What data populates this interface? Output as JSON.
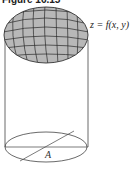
{
  "figure": {
    "caption": "Figure 16.15",
    "surface_label": "z = f(x, y)",
    "region_label": "A",
    "colors": {
      "surface_fill": "#b8b8b8",
      "lines": "#333333",
      "background": "#ffffff"
    }
  }
}
